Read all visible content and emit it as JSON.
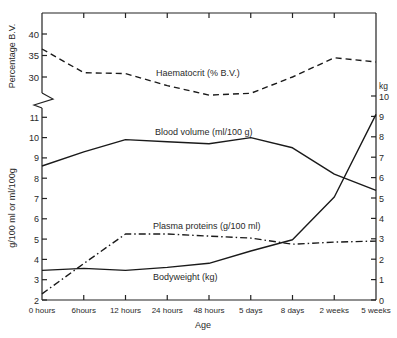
{
  "chart_data": {
    "type": "line",
    "title": "",
    "xlabel": "Age",
    "categories": [
      "0 hours",
      "6hours",
      "12 hours",
      "24 hours",
      "48  hours",
      "5 days",
      "8 days",
      "2 weeks",
      "5 weeks"
    ],
    "axes": {
      "upper_left": {
        "label": "Percentage B.V.",
        "ticks": [
          30,
          35,
          40
        ],
        "range": [
          25,
          45
        ]
      },
      "lower_left": {
        "label": "g/100 ml  or  ml/100 g",
        "ticks": [
          2,
          3,
          4,
          5,
          6,
          7,
          8,
          9,
          10,
          11
        ],
        "range": [
          2,
          11.5
        ]
      },
      "right": {
        "label": "kg",
        "ticks": [
          0,
          1,
          2,
          3,
          4,
          5,
          6,
          7,
          8,
          9,
          10
        ],
        "range": [
          0,
          10
        ]
      }
    },
    "series": [
      {
        "name": "Haematocrit (% B.V.)",
        "axis": "upper_left",
        "style": "dashed",
        "values": [
          36.5,
          31.0,
          30.8,
          28.0,
          25.8,
          26.2,
          30.0,
          34.5,
          33.5
        ]
      },
      {
        "name": "Blood volume (ml/100 g)",
        "axis": "lower_left",
        "style": "solid",
        "values": [
          8.6,
          9.3,
          9.9,
          9.8,
          9.7,
          10.0,
          9.5,
          8.2,
          7.4
        ]
      },
      {
        "name": "Plasma proteins (g/100 ml)",
        "axis": "lower_left",
        "style": "dash-dot",
        "values": [
          2.3,
          3.8,
          5.25,
          5.25,
          5.15,
          5.05,
          4.75,
          4.85,
          4.9
        ]
      },
      {
        "name": "Bodyweight (kg)",
        "axis": "right",
        "style": "solid",
        "values": [
          1.45,
          1.55,
          1.45,
          1.6,
          1.8,
          2.4,
          2.95,
          5.05,
          9.1
        ]
      }
    ],
    "annotations": [
      {
        "text": "Haematocrit (% B.V.)",
        "series": 0
      },
      {
        "text": "Blood volume (ml/100 g)",
        "series": 1
      },
      {
        "text": "Plasma proteins (g/100 ml)",
        "series": 2
      },
      {
        "text": "Bodyweight (kg)",
        "series": 3
      }
    ],
    "grid": false,
    "legend": "inline labels"
  },
  "labels": {
    "upper_ylabel": "Percentage B.V.",
    "lower_ylabel": "g/100 ml   or   ml/100g",
    "right_unit": "kg",
    "xlabel": "Age",
    "haematocrit": "Haematocrit (% B.V.)",
    "blood_volume": "Blood volume (ml/100 g)",
    "plasma_proteins": "Plasma proteins (g/100 ml)",
    "bodyweight": "Bodyweight (kg)"
  }
}
